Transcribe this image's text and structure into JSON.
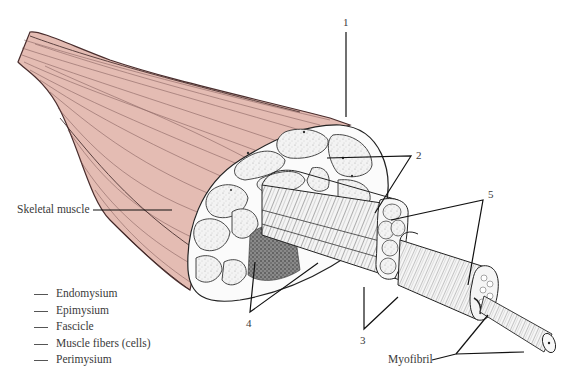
{
  "diagram": {
    "labels": {
      "skeletal_muscle": "Skeletal muscle",
      "myofibril": "Myofibril"
    },
    "numbered_callouts": [
      {
        "number": "1"
      },
      {
        "number": "2"
      },
      {
        "number": "3"
      },
      {
        "number": "4"
      },
      {
        "number": "5"
      }
    ],
    "answer_key": [
      {
        "blank": "___",
        "term": "Endomysium"
      },
      {
        "blank": "___",
        "term": "Epimysium"
      },
      {
        "blank": "___",
        "term": "Fascicle"
      },
      {
        "blank": "___",
        "term": "Muscle fibers (cells)"
      },
      {
        "blank": "___",
        "term": "Perimysium"
      }
    ],
    "colors": {
      "muscle_fill": "#e4bcb3",
      "muscle_stroke": "#5a3a3a",
      "line": "#222222",
      "tissue_fill": "#f2f2f2"
    }
  }
}
